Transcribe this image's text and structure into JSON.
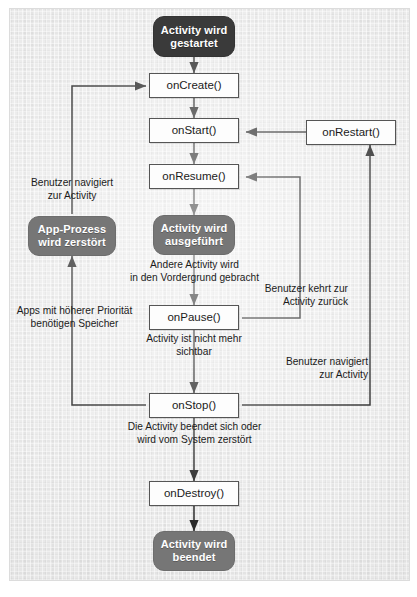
{
  "figure": {
    "language": "de",
    "background_color": "#ebebeb",
    "frame_color": "#dcdcdc"
  },
  "colors": {
    "state_start_fill": "#3a3a3a",
    "state_mid_fill": "#767676",
    "callback_fill": "#fdfdfd",
    "callback_border": "#555555",
    "edge_color": "#2b2b2b",
    "text_color": "#1b1b1b",
    "state_text_color": "#ffffff"
  },
  "nodes": {
    "start": {
      "label": "Activity wird\ngestartet",
      "line1": "Activity wird",
      "line2": "gestartet",
      "type": "state",
      "tone": "dark"
    },
    "on_create": {
      "label": "onCreate()",
      "type": "callback"
    },
    "on_start": {
      "label": "onStart()",
      "type": "callback"
    },
    "on_restart": {
      "label": "onRestart()",
      "type": "callback"
    },
    "on_resume": {
      "label": "onResume()",
      "type": "callback"
    },
    "running": {
      "label": "Activity wird\nausgeführt",
      "line1": "Activity wird",
      "line2": "ausgeführt",
      "type": "state",
      "tone": "mid"
    },
    "process_killed": {
      "label": "App-Prozess\nwird zerstört",
      "line1": "App-Prozess",
      "line2": "wird zerstört",
      "type": "state",
      "tone": "mid"
    },
    "on_pause": {
      "label": "onPause()",
      "type": "callback"
    },
    "on_stop": {
      "label": "onStop()",
      "type": "callback"
    },
    "on_destroy": {
      "label": "onDestroy()",
      "type": "callback"
    },
    "shutdown": {
      "label": "Activity wird\nbeendet",
      "line1": "Activity wird",
      "line2": "beendet",
      "type": "state",
      "tone": "mid"
    }
  },
  "edge_labels": {
    "user_navigates_to_activity_left": {
      "line1": "Benutzer navigiert",
      "line2": "zur Activity"
    },
    "other_activity_foreground": {
      "line1": "Andere Activity wird",
      "line2": "in den Vordergrund gebracht"
    },
    "user_returns_to_activity": {
      "line1": "Benutzer kehrt zur",
      "line2": "Activity zurück"
    },
    "higher_priority_apps_need_memory": {
      "line1": "Apps mit höherer Priorität",
      "line2": "benötigen Speicher"
    },
    "activity_no_longer_visible": {
      "line1": "Activity ist nicht mehr",
      "line2": "sichtbar"
    },
    "user_navigates_to_activity_right": {
      "line1": "Benutzer navigiert",
      "line2": "zur Activity"
    },
    "activity_finishes_or_destroyed": {
      "line1": "Die Activity beendet sich oder",
      "line2": "wird vom System zerstört"
    }
  }
}
